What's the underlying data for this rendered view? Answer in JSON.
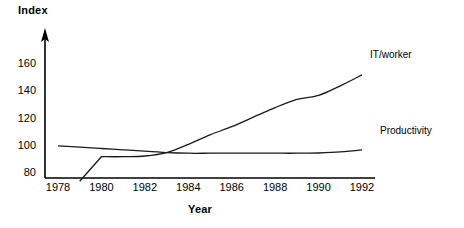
{
  "chart_data": {
    "type": "line",
    "title": "",
    "xlabel": "Year",
    "ylabel": "Index",
    "x": [
      1978,
      1979,
      1980,
      1981,
      1982,
      1983,
      1984,
      1985,
      1986,
      1987,
      1988,
      1989,
      1990,
      1991,
      1992
    ],
    "xticks": [
      "1978",
      "1980",
      "1982",
      "1984",
      "1986",
      "1988",
      "1990",
      "1992"
    ],
    "yticks": [
      "80",
      "100",
      "120",
      "140",
      "160"
    ],
    "xlim": [
      1977.4,
      1992.6
    ],
    "ylim": [
      73,
      170
    ],
    "grid": false,
    "legend_position": "inline-right",
    "series": [
      {
        "name": "IT/worker",
        "label": "IT/worker",
        "color": "#1a1a1a",
        "values": [
          null,
          74,
          92,
          92,
          92.5,
          95,
          101,
          108,
          114,
          121,
          128,
          134,
          137,
          144,
          152
        ]
      },
      {
        "name": "Productivity",
        "label": "Productivity",
        "color": "#1a1a1a",
        "values": [
          100,
          99,
          98,
          97,
          96,
          95,
          94.5,
          94.5,
          94.5,
          94.5,
          94.5,
          94.5,
          94.7,
          95.5,
          97
        ]
      }
    ]
  },
  "axes": {
    "y_title": "Index",
    "x_title": "Year"
  },
  "labels": {
    "it_worker": "IT/worker",
    "productivity": "Productivity"
  },
  "colors": {
    "line": "#1a1a1a",
    "axis": "#000000",
    "background": "#ffffff"
  }
}
